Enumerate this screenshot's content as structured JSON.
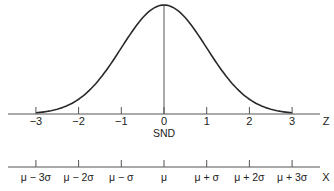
{
  "chart_data": [
    {
      "type": "line",
      "title": "",
      "xlabel": "SND",
      "axis_end_label": "Z",
      "ylabel": "",
      "x_ticks": [
        -3,
        -2,
        -1,
        0,
        1,
        2,
        3
      ],
      "x_tick_labels": [
        "−3",
        "−2",
        "−1",
        "0",
        "1",
        "2",
        "3"
      ],
      "xlim": [
        -3.65,
        3.6
      ],
      "curve": "standard normal density",
      "series": [
        {
          "name": "Standard Normal Distribution",
          "x": [
            -3,
            -2.5,
            -2,
            -1.5,
            -1,
            -0.5,
            0,
            0.5,
            1,
            1.5,
            2,
            2.5,
            3
          ],
          "y": [
            0.0044,
            0.0175,
            0.054,
            0.1295,
            0.242,
            0.3521,
            0.3989,
            0.3521,
            0.242,
            0.1295,
            0.054,
            0.0175,
            0.0044
          ]
        }
      ],
      "annotations": [
        "vertical line at mean (0)"
      ],
      "grid": false,
      "legend": "none"
    },
    {
      "type": "axis",
      "xlabel": "",
      "axis_end_label": "X",
      "x_ticks": [
        "μ − 3σ",
        "μ − 2σ",
        "μ − σ",
        "μ",
        "μ + σ",
        "μ + 2σ",
        "μ + 3σ"
      ]
    }
  ],
  "labels": {
    "z_axis": {
      "ticks": [
        "−3",
        "−2",
        "−1",
        "0",
        "1",
        "2",
        "3"
      ],
      "end": "Z",
      "name": "SND"
    },
    "x_axis": {
      "ticks": [
        "μ − 3σ",
        "μ − 2σ",
        "μ − σ",
        "μ",
        "μ + σ",
        "μ + 2σ",
        "μ + 3σ"
      ],
      "end": "X"
    }
  },
  "colors": {
    "line": "#2a2a2a",
    "axis": "#555555",
    "background": "#ffffff"
  }
}
